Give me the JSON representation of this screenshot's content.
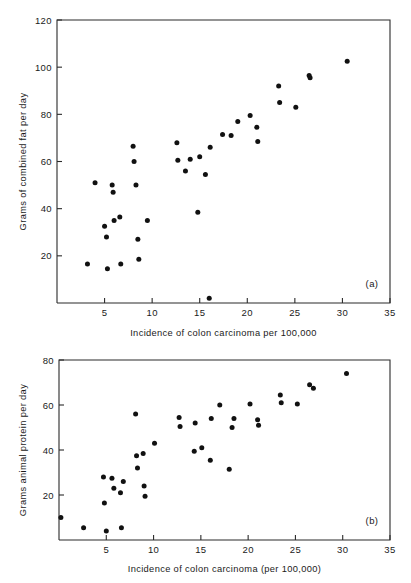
{
  "figure": {
    "panels": [
      {
        "tag": "(a)",
        "xlabel": "Incidence of colon carcinoma per 100,000",
        "ylabel": "Grams of combined fat per day"
      },
      {
        "tag": "(b)",
        "xlabel": "Incidence of colon carcinoma (per 100,000)",
        "ylabel": "Grams animal protein per day"
      }
    ]
  },
  "chart_data": [
    {
      "type": "scatter",
      "panel": "(a)",
      "title": "",
      "xlabel": "Incidence of colon carcinoma per 100,000",
      "ylabel": "Grams of combined fat per day",
      "xlim": [
        0,
        35
      ],
      "ylim": [
        0,
        120
      ],
      "xticks": [
        5,
        10,
        15,
        20,
        25,
        30,
        35
      ],
      "yticks": [
        20,
        40,
        60,
        80,
        100,
        120
      ],
      "grid": false,
      "legend": null,
      "marker": "filled-circle",
      "points": [
        {
          "x": 3.2,
          "y": 16.5
        },
        {
          "x": 4.0,
          "y": 51.0
        },
        {
          "x": 5.0,
          "y": 32.5
        },
        {
          "x": 5.2,
          "y": 28.0
        },
        {
          "x": 5.3,
          "y": 14.5
        },
        {
          "x": 5.8,
          "y": 50.0
        },
        {
          "x": 5.9,
          "y": 47.0
        },
        {
          "x": 6.0,
          "y": 35.0
        },
        {
          "x": 6.6,
          "y": 36.5
        },
        {
          "x": 6.7,
          "y": 16.5
        },
        {
          "x": 8.0,
          "y": 66.5
        },
        {
          "x": 8.1,
          "y": 60.0
        },
        {
          "x": 8.3,
          "y": 50.0
        },
        {
          "x": 8.5,
          "y": 27.0
        },
        {
          "x": 8.6,
          "y": 18.5
        },
        {
          "x": 9.5,
          "y": 35.0
        },
        {
          "x": 12.6,
          "y": 68.0
        },
        {
          "x": 12.7,
          "y": 60.5
        },
        {
          "x": 13.5,
          "y": 56.0
        },
        {
          "x": 14.0,
          "y": 61.0
        },
        {
          "x": 15.0,
          "y": 62.0
        },
        {
          "x": 14.8,
          "y": 38.5
        },
        {
          "x": 15.6,
          "y": 54.5
        },
        {
          "x": 16.0,
          "y": 2.0
        },
        {
          "x": 16.1,
          "y": 66.0
        },
        {
          "x": 17.4,
          "y": 71.5
        },
        {
          "x": 18.3,
          "y": 71.0
        },
        {
          "x": 19.0,
          "y": 77.0
        },
        {
          "x": 20.3,
          "y": 79.5
        },
        {
          "x": 21.0,
          "y": 74.5
        },
        {
          "x": 21.1,
          "y": 68.5
        },
        {
          "x": 23.3,
          "y": 92.0
        },
        {
          "x": 23.4,
          "y": 85.0
        },
        {
          "x": 25.1,
          "y": 83.0
        },
        {
          "x": 26.5,
          "y": 96.5
        },
        {
          "x": 26.6,
          "y": 95.5
        },
        {
          "x": 30.5,
          "y": 102.5
        }
      ]
    },
    {
      "type": "scatter",
      "panel": "(b)",
      "title": "",
      "xlabel": "Incidence of colon carcinoma (per 100,000)",
      "ylabel": "Grams animal protein per day",
      "xlim": [
        0,
        35
      ],
      "ylim": [
        0,
        80
      ],
      "xticks": [
        5,
        10,
        15,
        20,
        25,
        30,
        35
      ],
      "yticks": [
        20,
        40,
        60,
        80
      ],
      "grid": false,
      "legend": null,
      "marker": "filled-circle",
      "points": [
        {
          "x": 0.2,
          "y": 10.0
        },
        {
          "x": 2.6,
          "y": 5.5
        },
        {
          "x": 4.7,
          "y": 28.0
        },
        {
          "x": 4.8,
          "y": 16.5
        },
        {
          "x": 5.0,
          "y": 4.0
        },
        {
          "x": 5.6,
          "y": 27.5
        },
        {
          "x": 5.8,
          "y": 23.0
        },
        {
          "x": 6.5,
          "y": 21.0
        },
        {
          "x": 6.6,
          "y": 5.5
        },
        {
          "x": 6.8,
          "y": 26.0
        },
        {
          "x": 8.1,
          "y": 56.0
        },
        {
          "x": 8.2,
          "y": 37.5
        },
        {
          "x": 8.3,
          "y": 32.0
        },
        {
          "x": 8.9,
          "y": 38.5
        },
        {
          "x": 9.0,
          "y": 24.0
        },
        {
          "x": 9.1,
          "y": 19.5
        },
        {
          "x": 10.1,
          "y": 43.0
        },
        {
          "x": 12.7,
          "y": 54.5
        },
        {
          "x": 12.8,
          "y": 50.5
        },
        {
          "x": 14.3,
          "y": 39.5
        },
        {
          "x": 14.4,
          "y": 52.0
        },
        {
          "x": 15.1,
          "y": 41.0
        },
        {
          "x": 16.0,
          "y": 35.5
        },
        {
          "x": 16.1,
          "y": 54.0
        },
        {
          "x": 17.0,
          "y": 60.0
        },
        {
          "x": 18.0,
          "y": 31.5
        },
        {
          "x": 18.3,
          "y": 50.0
        },
        {
          "x": 18.5,
          "y": 54.0
        },
        {
          "x": 20.2,
          "y": 60.5
        },
        {
          "x": 21.0,
          "y": 53.5
        },
        {
          "x": 21.1,
          "y": 51.0
        },
        {
          "x": 23.4,
          "y": 64.5
        },
        {
          "x": 23.5,
          "y": 61.0
        },
        {
          "x": 25.2,
          "y": 60.5
        },
        {
          "x": 26.5,
          "y": 69.0
        },
        {
          "x": 26.9,
          "y": 67.5
        },
        {
          "x": 30.4,
          "y": 74.0
        }
      ]
    }
  ]
}
